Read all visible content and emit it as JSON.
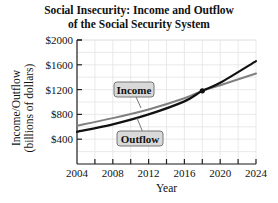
{
  "chart_data": {
    "type": "line",
    "title": "Social Insecurity: Income and Outflow of the Social Security System",
    "title_lines": [
      "Social Insecurity: Income and Outflow",
      "of the Social Security System"
    ],
    "xlabel": "Year",
    "ylabel": "Income/Outflow",
    "ylabel_sub": "(billions of dollars)",
    "xlim": [
      2004,
      2024
    ],
    "ylim": [
      0,
      2000
    ],
    "x_ticks": [
      2004,
      2008,
      2012,
      2016,
      2020,
      2024
    ],
    "x_tick_labels": [
      "2004",
      "2008",
      "2012",
      "2016",
      "2020",
      "2024"
    ],
    "y_ticks": [
      400,
      800,
      1200,
      1600,
      2000
    ],
    "y_tick_labels": [
      "$400",
      "$800",
      "$1200",
      "$1600",
      "$2000"
    ],
    "grid": true,
    "series": [
      {
        "name": "Income",
        "color": "#808080",
        "x": [
          2004,
          2008,
          2012,
          2016,
          2018,
          2020,
          2024
        ],
        "values": [
          620,
          740,
          880,
          1060,
          1180,
          1270,
          1460
        ]
      },
      {
        "name": "Outflow",
        "color": "#111111",
        "x": [
          2004,
          2008,
          2012,
          2016,
          2018,
          2020,
          2024
        ],
        "values": [
          520,
          640,
          800,
          1010,
          1180,
          1310,
          1660
        ]
      }
    ],
    "annotations": [
      {
        "type": "point",
        "x": 2018,
        "y": 1180,
        "label": "intersection"
      },
      {
        "type": "callout",
        "text": "Income",
        "series": "Income"
      },
      {
        "type": "callout",
        "text": "Outflow",
        "series": "Outflow"
      }
    ]
  }
}
